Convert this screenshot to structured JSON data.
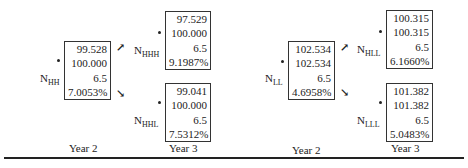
{
  "trees": [
    {
      "root": {
        "label": "N",
        "sub": "HH",
        "values": [
          "99.528",
          "100.000",
          "6.5",
          "7.0053%"
        ]
      },
      "up": {
        "label": "N",
        "sub": "HHH",
        "values": [
          "97.529",
          "100.000",
          "6.5",
          "9.1987%"
        ]
      },
      "down": {
        "label": "N",
        "sub": "HHL",
        "values": [
          "99.041",
          "100.000",
          "6.5",
          "7.5312%"
        ]
      },
      "year_left": "Year 2",
      "year_right": "Year 3"
    },
    {
      "root": {
        "label": "N",
        "sub": "LL",
        "values": [
          "102.534",
          "102.534",
          "6.5",
          "4.6958%"
        ]
      },
      "up": {
        "label": "N",
        "sub": "HLL",
        "values": [
          "100.315",
          "100.315",
          "6.5",
          "6.1660%"
        ]
      },
      "down": {
        "label": "N",
        "sub": "LLL",
        "values": [
          "101.382",
          "101.382",
          "6.5",
          "5.0483%"
        ]
      },
      "year_left": "Year 2",
      "year_right": "Year 3"
    }
  ],
  "icons": {
    "up": "↗",
    "down": "↘"
  }
}
